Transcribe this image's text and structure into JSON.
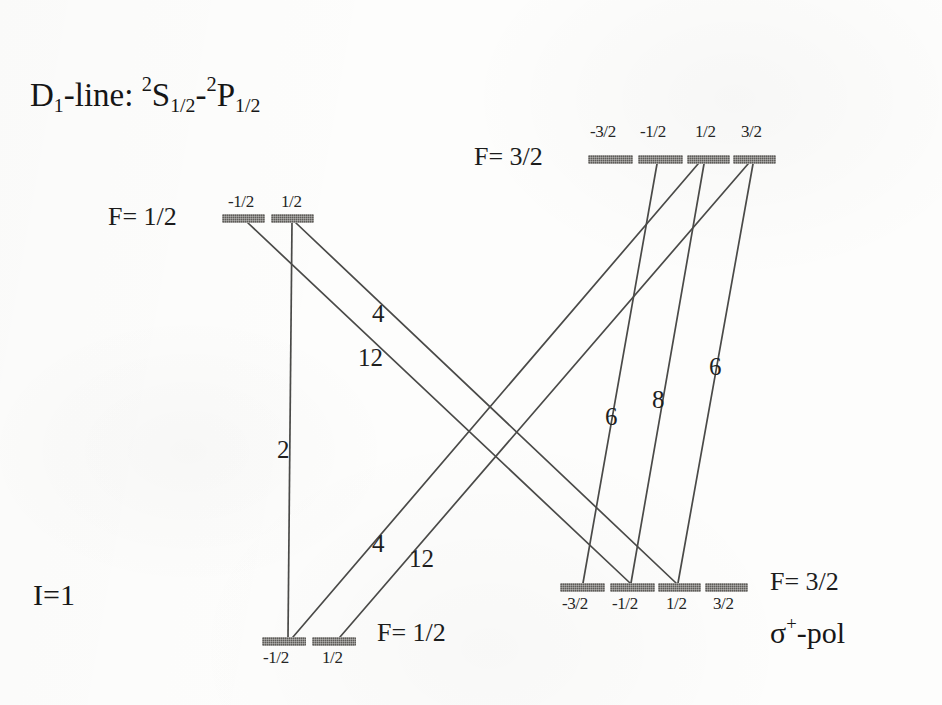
{
  "figure": {
    "title_prefix": "D",
    "title_sub": "1",
    "title_mid": "-line: ",
    "title_term1_sup": "2",
    "title_term1_letter": "S",
    "title_term1_sub": "1/2",
    "title_dash": "-",
    "title_term2_sup": "2",
    "title_term2_letter": "P",
    "title_term2_sub": "1/2",
    "title_plain": "D1-line: 2S1/2-2P1/2",
    "nuclear_spin": "I=1",
    "polarization_sigma": "σ",
    "polarization_sup": "+",
    "polarization_rest": "-pol",
    "polarization_plain": "σ+-pol",
    "ink_color": "#1f1f1f",
    "level_color": "#5d5b58",
    "background_color": "#fdfdfc"
  },
  "levels": [
    {
      "id": "upper-left",
      "group_label": "F= 1/2",
      "group_label_x": 108,
      "group_label_y": 202,
      "sublevel_label_position": "above",
      "bar_y": 214,
      "bar_height": 9,
      "sublevels": [
        {
          "m": "-1/2",
          "x": 222,
          "width": 43,
          "label_x": 228,
          "label_y": 192
        },
        {
          "m": "1/2",
          "x": 271,
          "width": 43,
          "label_x": 281,
          "label_y": 192
        }
      ]
    },
    {
      "id": "upper-right",
      "group_label": "F= 3/2",
      "group_label_x": 474,
      "group_label_y": 142,
      "sublevel_label_position": "above",
      "bar_y": 155,
      "bar_height": 9,
      "sublevels": [
        {
          "m": "-3/2",
          "x": 588,
          "width": 45,
          "label_x": 590,
          "label_y": 122
        },
        {
          "m": "-1/2",
          "x": 638,
          "width": 45,
          "label_x": 640,
          "label_y": 122
        },
        {
          "m": "1/2",
          "x": 687,
          "width": 43,
          "label_x": 695,
          "label_y": 122
        },
        {
          "m": "3/2",
          "x": 733,
          "width": 43,
          "label_x": 741,
          "label_y": 122
        }
      ]
    },
    {
      "id": "lower-right",
      "group_label": "F= 3/2",
      "group_label_x": 770,
      "group_label_y": 567,
      "sublevel_label_position": "below",
      "bar_y": 583,
      "bar_height": 9,
      "sublevels": [
        {
          "m": "-3/2",
          "x": 560,
          "width": 45,
          "label_x": 562,
          "label_y": 594
        },
        {
          "m": "-1/2",
          "x": 610,
          "width": 45,
          "label_x": 612,
          "label_y": 594
        },
        {
          "m": "1/2",
          "x": 658,
          "width": 43,
          "label_x": 666,
          "label_y": 594
        },
        {
          "m": "3/2",
          "x": 705,
          "width": 43,
          "label_x": 713,
          "label_y": 594
        }
      ]
    },
    {
      "id": "lower-left",
      "group_label": "F= 1/2",
      "group_label_x": 377,
      "group_label_y": 618,
      "sublevel_label_position": "below",
      "bar_y": 637,
      "bar_height": 9,
      "sublevels": [
        {
          "m": "-1/2",
          "x": 262,
          "width": 44,
          "label_x": 263,
          "label_y": 648
        },
        {
          "m": "1/2",
          "x": 312,
          "width": 44,
          "label_x": 322,
          "label_y": 648
        }
      ]
    }
  ],
  "transitions": [
    {
      "name": "ul-half-to-ll-minushalf",
      "strength": "2",
      "from_level": "upper-left",
      "from_m": "1/2",
      "to_level": "lower-left",
      "to_m": "-1/2",
      "x1": 292,
      "y1": 223,
      "x2": 288,
      "y2": 637,
      "label_x": 277,
      "label_y": 436
    },
    {
      "name": "ul-minushalf-to-lr-minushalf",
      "strength": "4",
      "from_level": "upper-left",
      "from_m": "-1/2",
      "to_level": "lower-right",
      "to_m": "-1/2",
      "x1": 248,
      "y1": 223,
      "x2": 630,
      "y2": 583,
      "label_x": 372,
      "label_y": 300
    },
    {
      "name": "ul-half-to-lr-halfplus",
      "strength": "12",
      "from_level": "upper-left",
      "from_m": "1/2",
      "to_level": "lower-right",
      "to_m": "1/2",
      "x1": 296,
      "y1": 223,
      "x2": 676,
      "y2": 583,
      "label_x": 358,
      "label_y": 344
    },
    {
      "name": "ur-half-to-ll-minushalf",
      "strength": "4",
      "from_level": "upper-right",
      "from_m": "1/2",
      "to_level": "lower-left",
      "to_m": "-1/2",
      "x1": 698,
      "y1": 164,
      "x2": 293,
      "y2": 637,
      "label_x": 372,
      "label_y": 530
    },
    {
      "name": "ur-threehalf-to-ll-half",
      "strength": "12",
      "from_level": "upper-right",
      "from_m": "3/2",
      "to_level": "lower-left",
      "to_m": "1/2",
      "x1": 748,
      "y1": 164,
      "x2": 340,
      "y2": 637,
      "label_x": 409,
      "label_y": 545
    },
    {
      "name": "ur-minushalf-to-lr-minusthreehalf",
      "strength": "6",
      "from_level": "upper-right",
      "from_m": "-1/2",
      "to_level": "lower-right",
      "to_m": "-3/2",
      "x1": 657,
      "y1": 164,
      "x2": 583,
      "y2": 583,
      "label_x": 605,
      "label_y": 403
    },
    {
      "name": "ur-half-to-lr-minushalf",
      "strength": "8",
      "from_level": "upper-right",
      "from_m": "1/2",
      "to_level": "lower-right",
      "to_m": "-1/2",
      "x1": 704,
      "y1": 164,
      "x2": 631,
      "y2": 583,
      "label_x": 652,
      "label_y": 386
    },
    {
      "name": "ur-threehalf-to-lr-half",
      "strength": "6",
      "from_level": "upper-right",
      "from_m": "3/2",
      "to_level": "lower-right",
      "to_m": "1/2",
      "x1": 753,
      "y1": 164,
      "x2": 678,
      "y2": 583,
      "label_x": 709,
      "label_y": 353
    }
  ]
}
